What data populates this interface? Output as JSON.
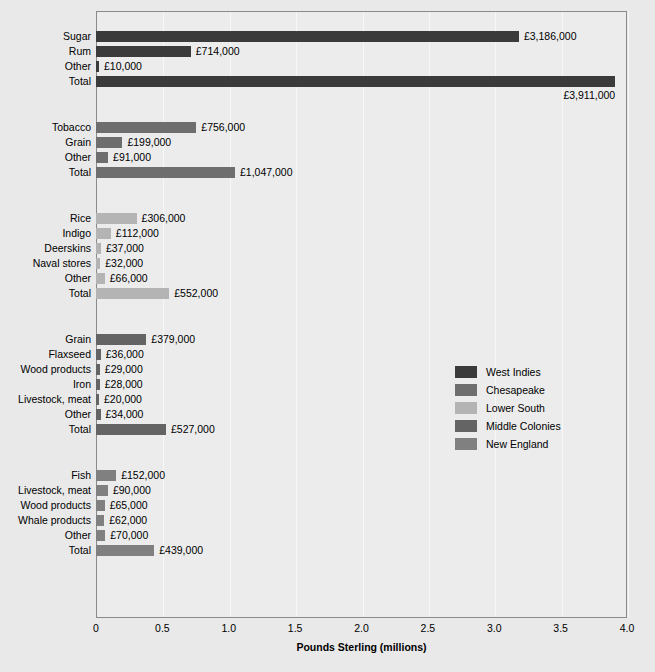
{
  "chart_data": {
    "type": "bar",
    "orientation": "horizontal",
    "title": "",
    "xlabel": "Pounds Sterling (millions)",
    "ylabel": "",
    "xlim": [
      0,
      4.0
    ],
    "xticks": [
      "0",
      "0.5",
      "1.0",
      "1.5",
      "2.0",
      "2.5",
      "3.0",
      "3.5",
      "4.0"
    ],
    "xtick_values": [
      0,
      0.5,
      1.0,
      1.5,
      2.0,
      2.5,
      3.0,
      3.5,
      4.0
    ],
    "grid": true,
    "grid_axis": "x",
    "legend_position": "center-right",
    "value_unit": "pounds sterling",
    "legend": [
      {
        "label": "West Indies",
        "color": "#3b3b3b"
      },
      {
        "label": "Chesapeake",
        "color": "#6e6e6e"
      },
      {
        "label": "Lower South",
        "color": "#b4b4b4"
      },
      {
        "label": "Middle Colonies",
        "color": "#646464"
      },
      {
        "label": "New England",
        "color": "#808080"
      }
    ],
    "groups": [
      {
        "name": "West Indies",
        "color": "#3b3b3b",
        "rows": [
          {
            "label": "Sugar",
            "value": 3186000,
            "value_label": "£3,186,000",
            "value_millions": 3.186,
            "label_below": false
          },
          {
            "label": "Rum",
            "value": 714000,
            "value_label": "£714,000",
            "value_millions": 0.714,
            "label_below": false
          },
          {
            "label": "Other",
            "value": 10000,
            "value_label": "£10,000",
            "value_millions": 0.01,
            "label_below": false
          },
          {
            "label": "Total",
            "value": 3911000,
            "value_label": "£3,911,000",
            "value_millions": 3.911,
            "label_below": true,
            "is_total": true
          }
        ]
      },
      {
        "name": "Chesapeake",
        "color": "#6e6e6e",
        "rows": [
          {
            "label": "Tobacco",
            "value": 756000,
            "value_label": "£756,000",
            "value_millions": 0.756,
            "label_below": false
          },
          {
            "label": "Grain",
            "value": 199000,
            "value_label": "£199,000",
            "value_millions": 0.199,
            "label_below": false
          },
          {
            "label": "Other",
            "value": 91000,
            "value_label": "£91,000",
            "value_millions": 0.091,
            "label_below": false
          },
          {
            "label": "Total",
            "value": 1047000,
            "value_label": "£1,047,000",
            "value_millions": 1.047,
            "label_below": false,
            "is_total": true
          }
        ]
      },
      {
        "name": "Lower South",
        "color": "#b4b4b4",
        "rows": [
          {
            "label": "Rice",
            "value": 306000,
            "value_label": "£306,000",
            "value_millions": 0.306,
            "label_below": false
          },
          {
            "label": "Indigo",
            "value": 112000,
            "value_label": "£112,000",
            "value_millions": 0.112,
            "label_below": false
          },
          {
            "label": "Deerskins",
            "value": 37000,
            "value_label": "£37,000",
            "value_millions": 0.037,
            "label_below": false
          },
          {
            "label": "Naval stores",
            "value": 32000,
            "value_label": "£32,000",
            "value_millions": 0.032,
            "label_below": false
          },
          {
            "label": "Other",
            "value": 66000,
            "value_label": "£66,000",
            "value_millions": 0.066,
            "label_below": false
          },
          {
            "label": "Total",
            "value": 552000,
            "value_label": "£552,000",
            "value_millions": 0.552,
            "label_below": false,
            "is_total": true
          }
        ]
      },
      {
        "name": "Middle Colonies",
        "color": "#646464",
        "rows": [
          {
            "label": "Grain",
            "value": 379000,
            "value_label": "£379,000",
            "value_millions": 0.379,
            "label_below": false
          },
          {
            "label": "Flaxseed",
            "value": 36000,
            "value_label": "£36,000",
            "value_millions": 0.036,
            "label_below": false
          },
          {
            "label": "Wood products",
            "value": 29000,
            "value_label": "£29,000",
            "value_millions": 0.029,
            "label_below": false
          },
          {
            "label": "Iron",
            "value": 28000,
            "value_label": "£28,000",
            "value_millions": 0.028,
            "label_below": false
          },
          {
            "label": "Livestock, meat",
            "value": 20000,
            "value_label": "£20,000",
            "value_millions": 0.02,
            "label_below": false
          },
          {
            "label": "Other",
            "value": 34000,
            "value_label": "£34,000",
            "value_millions": 0.034,
            "label_below": false
          },
          {
            "label": "Total",
            "value": 527000,
            "value_label": "£527,000",
            "value_millions": 0.527,
            "label_below": false,
            "is_total": true
          }
        ]
      },
      {
        "name": "New England",
        "color": "#808080",
        "rows": [
          {
            "label": "Fish",
            "value": 152000,
            "value_label": "£152,000",
            "value_millions": 0.152,
            "label_below": false
          },
          {
            "label": "Livestock, meat",
            "value": 90000,
            "value_label": "£90,000",
            "value_millions": 0.09,
            "label_below": false
          },
          {
            "label": "Wood products",
            "value": 65000,
            "value_label": "£65,000",
            "value_millions": 0.065,
            "label_below": false
          },
          {
            "label": "Whale products",
            "value": 62000,
            "value_label": "£62,000",
            "value_millions": 0.062,
            "label_below": false
          },
          {
            "label": "Other",
            "value": 70000,
            "value_label": "£70,000",
            "value_millions": 0.07,
            "label_below": false
          },
          {
            "label": "Total",
            "value": 439000,
            "value_label": "£439,000",
            "value_millions": 0.439,
            "label_below": false,
            "is_total": true
          }
        ]
      }
    ]
  }
}
